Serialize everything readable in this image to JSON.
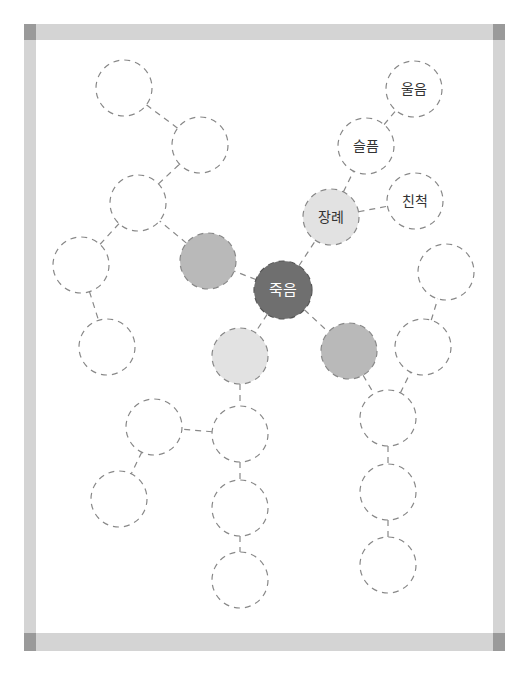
{
  "worksheet": {
    "type": "mind-map",
    "colors": {
      "frame": "#d4d4d4",
      "frame_corner": "#9a9a9a",
      "center_fill": "#6f6f6f",
      "mid_fill": "#b9b9b9",
      "light_fill": "#e2e2e2",
      "outline": "#888888"
    },
    "nodes": [
      {
        "id": "center",
        "label": "죽음",
        "x": 283,
        "y": 290,
        "r": 29,
        "fill": "center"
      },
      {
        "id": "funeral",
        "label": "장례",
        "x": 331,
        "y": 217,
        "r": 28,
        "fill": "light"
      },
      {
        "id": "sadness",
        "label": "슬픔",
        "x": 366,
        "y": 146,
        "r": 28,
        "fill": "none"
      },
      {
        "id": "crying",
        "label": "울음",
        "x": 414,
        "y": 89,
        "r": 28,
        "fill": "none"
      },
      {
        "id": "relatives",
        "label": "친척",
        "x": 415,
        "y": 201,
        "r": 28,
        "fill": "none"
      },
      {
        "id": "left-grey",
        "label": "",
        "x": 208,
        "y": 261,
        "r": 28,
        "fill": "mid"
      },
      {
        "id": "l1",
        "label": "",
        "x": 138,
        "y": 203,
        "r": 28,
        "fill": "none"
      },
      {
        "id": "l2",
        "label": "",
        "x": 200,
        "y": 145,
        "r": 28,
        "fill": "none"
      },
      {
        "id": "l3",
        "label": "",
        "x": 124,
        "y": 88,
        "r": 28,
        "fill": "none"
      },
      {
        "id": "l4",
        "label": "",
        "x": 81,
        "y": 265,
        "r": 28,
        "fill": "none"
      },
      {
        "id": "l5",
        "label": "",
        "x": 107,
        "y": 347,
        "r": 28,
        "fill": "none"
      },
      {
        "id": "bottom-light",
        "label": "",
        "x": 240,
        "y": 356,
        "r": 28,
        "fill": "light"
      },
      {
        "id": "b1",
        "label": "",
        "x": 240,
        "y": 434,
        "r": 28,
        "fill": "none"
      },
      {
        "id": "b2",
        "label": "",
        "x": 240,
        "y": 508,
        "r": 28,
        "fill": "none"
      },
      {
        "id": "b3",
        "label": "",
        "x": 240,
        "y": 580,
        "r": 28,
        "fill": "none"
      },
      {
        "id": "b4",
        "label": "",
        "x": 154,
        "y": 427,
        "r": 28,
        "fill": "none"
      },
      {
        "id": "b5",
        "label": "",
        "x": 119,
        "y": 499,
        "r": 28,
        "fill": "none"
      },
      {
        "id": "right-grey",
        "label": "",
        "x": 349,
        "y": 351,
        "r": 28,
        "fill": "mid"
      },
      {
        "id": "r1",
        "label": "",
        "x": 388,
        "y": 418,
        "r": 28,
        "fill": "none"
      },
      {
        "id": "r2",
        "label": "",
        "x": 388,
        "y": 492,
        "r": 28,
        "fill": "none"
      },
      {
        "id": "r3",
        "label": "",
        "x": 388,
        "y": 565,
        "r": 28,
        "fill": "none"
      },
      {
        "id": "r4",
        "label": "",
        "x": 423,
        "y": 347,
        "r": 28,
        "fill": "none"
      },
      {
        "id": "r5",
        "label": "",
        "x": 446,
        "y": 272,
        "r": 28,
        "fill": "none"
      }
    ],
    "edges": [
      [
        "center",
        "funeral"
      ],
      [
        "funeral",
        "sadness"
      ],
      [
        "sadness",
        "crying"
      ],
      [
        "funeral",
        "relatives"
      ],
      [
        "center",
        "left-grey"
      ],
      [
        "left-grey",
        "l1"
      ],
      [
        "l1",
        "l2"
      ],
      [
        "l2",
        "l3"
      ],
      [
        "l1",
        "l4"
      ],
      [
        "l4",
        "l5"
      ],
      [
        "center",
        "bottom-light"
      ],
      [
        "bottom-light",
        "b1"
      ],
      [
        "b1",
        "b2"
      ],
      [
        "b2",
        "b3"
      ],
      [
        "b1",
        "b4"
      ],
      [
        "b4",
        "b5"
      ],
      [
        "center",
        "right-grey"
      ],
      [
        "right-grey",
        "r1"
      ],
      [
        "r1",
        "r2"
      ],
      [
        "r2",
        "r3"
      ],
      [
        "r1",
        "r4"
      ],
      [
        "r4",
        "r5"
      ]
    ]
  }
}
